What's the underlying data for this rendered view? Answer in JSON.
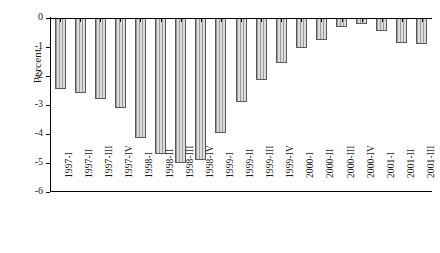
{
  "chart_data": {
    "type": "bar",
    "title": "",
    "subtitle": "",
    "xlabel": "",
    "ylabel": "Percent",
    "ylim": [
      -6,
      0
    ],
    "yticks": [
      0,
      -1,
      -2,
      -3,
      -4,
      -5,
      -6
    ],
    "ytick_labels": [
      "0",
      "-1",
      "-2",
      "-3",
      "-4",
      "-5",
      "-6"
    ],
    "grid": false,
    "legend": null,
    "bar_face_color": "#d2d2d2",
    "bar_edge_color": "#5a5a5a",
    "bar_hatch": "vertical-lines",
    "categories": [
      "1997-I",
      "1997-II",
      "1997-III",
      "1997-IV",
      "1998-I",
      "1998-II",
      "1998-III",
      "1998-IV",
      "1999-I",
      "1999-II",
      "1999-III",
      "1999-IV",
      "2000-I",
      "2000-II",
      "2000-III",
      "2000-IV",
      "2001-I",
      "2001-II",
      "2001-III"
    ],
    "values": [
      -2.45,
      -2.6,
      -2.8,
      -3.1,
      -4.15,
      -4.7,
      -5.0,
      -4.9,
      -3.95,
      -2.9,
      -2.15,
      -1.55,
      -1.05,
      -0.75,
      -0.3,
      -0.2,
      -0.45,
      -0.85,
      -0.9
    ]
  }
}
